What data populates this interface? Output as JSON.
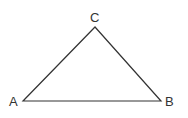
{
  "diagram": {
    "type": "triangle",
    "stroke_color": "#333333",
    "vertices": [
      {
        "name": "A",
        "x": 23,
        "y": 101
      },
      {
        "name": "B",
        "x": 161,
        "y": 101
      },
      {
        "name": "C",
        "x": 95,
        "y": 27
      }
    ],
    "labels": {
      "A": "A",
      "B": "B",
      "C": "C"
    }
  }
}
